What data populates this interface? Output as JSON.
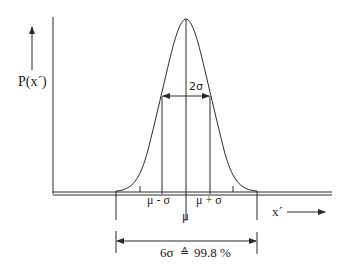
{
  "diagram": {
    "y_axis_label": "P(x´)",
    "x_axis_label": "x´",
    "center_label": "μ",
    "minus_sigma_label": "μ - σ",
    "plus_sigma_label": "μ + σ",
    "width_label": "2σ",
    "span_label_prefix": "6σ",
    "span_label_symbol": "≙",
    "span_label_value": "99.8 %",
    "colors": {
      "line": "#2a2a2a",
      "text": "#222222",
      "background": "#ffffff"
    }
  }
}
